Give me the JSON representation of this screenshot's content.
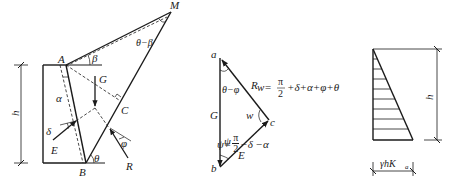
{
  "figure_1": {
    "title": "Wall and trial wedge",
    "points": {
      "A": "A",
      "B": "B",
      "C": "C",
      "M": "M"
    },
    "height_label": "h",
    "force_labels": {
      "G": "G",
      "E": "E",
      "R": "R"
    },
    "angle_labels": {
      "alpha": "α",
      "beta": "β",
      "delta": "δ",
      "phi": "φ",
      "theta": "θ",
      "theta_minus_beta": "θ−β"
    }
  },
  "figure_2": {
    "title": "Force polygon",
    "vertices": {
      "a": "a",
      "b": "b",
      "c": "c"
    },
    "force_labels": {
      "G": "G",
      "E": "E",
      "R": "R"
    },
    "angle_labels": {
      "theta_minus_phi": "θ−φ",
      "w": "w",
      "psi": "ψ"
    },
    "formula_w": {
      "lhs": "w=",
      "num": "π",
      "den": "2",
      "rest": "+δ+α+φ+θ"
    },
    "formula_psi": {
      "lhs": "ψ=",
      "num": "π",
      "den": "2",
      "rest": "−δ −α"
    }
  },
  "figure_3": {
    "title": "Earth pressure distribution",
    "height_label": "h",
    "base_label": "γhK",
    "base_subscript": "a",
    "hatch_lines": 8
  },
  "colors": {
    "stroke": "#1a1a1a",
    "background": "#ffffff"
  }
}
